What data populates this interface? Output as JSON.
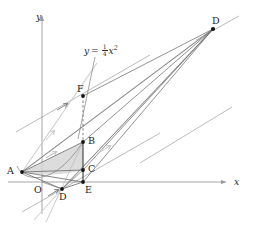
{
  "figure": {
    "type": "geometry-diagram",
    "width": 253,
    "height": 230,
    "background": "#ffffff"
  },
  "axes": {
    "x_label": "x",
    "y_label": "y",
    "origin_label": "O",
    "x_axis": {
      "x1": 8,
      "y1": 182,
      "x2": 228,
      "y2": 182
    },
    "y_axis": {
      "x1": 42,
      "y1": 214,
      "x2": 42,
      "y2": 14
    },
    "color": "#9a9a9a"
  },
  "curve": {
    "equation_lhs": "y",
    "equation_eq": "=",
    "equation_num": "1",
    "equation_den": "4",
    "equation_var": "x",
    "equation_exp": "2",
    "label_x": 84,
    "label_y": 47,
    "color": "#6f6f6f"
  },
  "points": [
    {
      "id": "A",
      "label": "A",
      "x": 22,
      "y": 172,
      "lx": 8,
      "ly": 167
    },
    {
      "id": "B",
      "label": "B",
      "x": 83,
      "y": 142,
      "lx": 88,
      "ly": 137
    },
    {
      "id": "C",
      "label": "C",
      "x": 83,
      "y": 170,
      "lx": 88,
      "ly": 165
    },
    {
      "id": "D",
      "label": "D",
      "x": 62,
      "y": 189,
      "lx": 60,
      "ly": 193
    },
    {
      "id": "E",
      "label": "E",
      "x": 83,
      "y": 182,
      "lx": 85,
      "ly": 187
    },
    {
      "id": "F",
      "label": "F",
      "x": 83,
      "y": 96,
      "lx": 78,
      "ly": 84
    },
    {
      "id": "Dtop",
      "label": "D",
      "x": 213,
      "y": 29,
      "lx": 213,
      "ly": 17
    }
  ],
  "shaded_region": {
    "name": "parabolic-segment-ABC",
    "fill": "#d6d6d6",
    "opacity": 0.78
  },
  "colors": {
    "axis": "#9a9a9a",
    "ray": "#6a6a6a",
    "light_ray": "#c9c9c9",
    "point": "#161616",
    "dashed": "#6a6a6a",
    "shade": "#d6d6d6"
  }
}
